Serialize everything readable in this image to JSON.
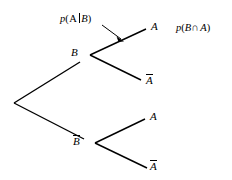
{
  "figure": {
    "type": "probability-tree-diagram",
    "background_color": "#ffffff",
    "line_color": "#000000",
    "width": 232,
    "height": 180
  },
  "annotations": {
    "conditional_label": {
      "text": "p(A|B)",
      "p": "p",
      "open_paren": "(",
      "event": "A",
      "given_bar": "|",
      "condition": "B",
      "close_paren": ")"
    },
    "joint_label": {
      "text": "p(B∩A)",
      "p": "p",
      "open_paren": "(",
      "first": "B",
      "operator": "∩",
      "second": "A",
      "close_paren": ")"
    }
  },
  "nodes": {
    "root": {
      "label": "",
      "x": 14,
      "y": 103
    },
    "branch_b": {
      "label": "B",
      "x": 90,
      "y": 55
    },
    "branch_bbar": {
      "label": "B",
      "overbar": true,
      "x": 93,
      "y": 143
    }
  },
  "leaves": [
    {
      "label": "A",
      "overbar": false,
      "parent": "B",
      "x": 151,
      "y": 28
    },
    {
      "label": "A",
      "overbar": true,
      "parent": "B",
      "x": 146,
      "y": 80
    },
    {
      "label": "A",
      "overbar": false,
      "parent": "Bbar",
      "x": 150,
      "y": 118
    },
    {
      "label": "A",
      "overbar": true,
      "parent": "Bbar",
      "x": 150,
      "y": 167
    }
  ],
  "arrow": {
    "name": "pointer-arrow",
    "from_x": 102,
    "from_y": 25,
    "to_x": 124,
    "to_y": 41
  }
}
